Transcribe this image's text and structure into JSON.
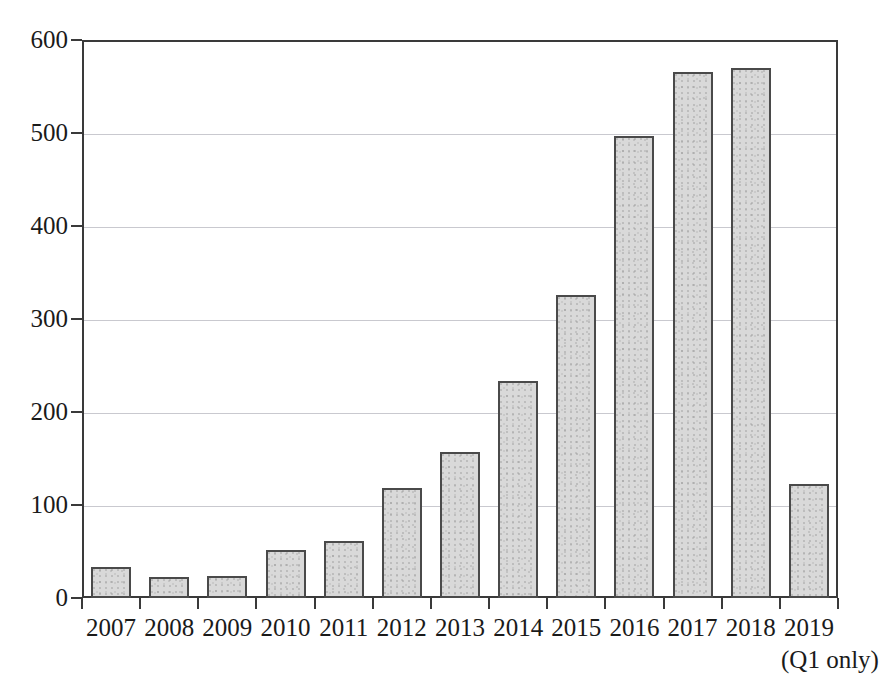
{
  "chart_data": {
    "type": "bar",
    "title": "",
    "subtitle": "",
    "xlabel": "",
    "ylabel": "",
    "categories": [
      "2007",
      "2008",
      "2009",
      "2010",
      "2011",
      "2012",
      "2013",
      "2014",
      "2015",
      "2016",
      "2017",
      "2018",
      "2019"
    ],
    "values": [
      33,
      23,
      24,
      52,
      61,
      118,
      157,
      233,
      326,
      497,
      566,
      570,
      123
    ],
    "ylim": [
      0,
      600
    ],
    "ytick_values": [
      0,
      100,
      200,
      300,
      400,
      500,
      600
    ],
    "ytick_labels": [
      "0",
      "100",
      "200",
      "300",
      "400",
      "500",
      "600"
    ],
    "grid": true,
    "grid_axis": "y",
    "legend": false,
    "legend_position": "none",
    "annotations": [
      {
        "text": "(Q1 only)",
        "anchor_category": "2019",
        "position": "below-axis-right"
      }
    ],
    "series": [
      {
        "name": "",
        "values": [
          33,
          23,
          24,
          52,
          61,
          118,
          157,
          233,
          326,
          497,
          566,
          570,
          123
        ]
      }
    ]
  },
  "style": {
    "bar_fill": "#d9d9d9",
    "bar_border": "#4a4a4a",
    "axis_color": "#3a3a3a",
    "grid_color": "#c9c9cf",
    "text_color": "#1a1a1a",
    "background": "#ffffff"
  }
}
